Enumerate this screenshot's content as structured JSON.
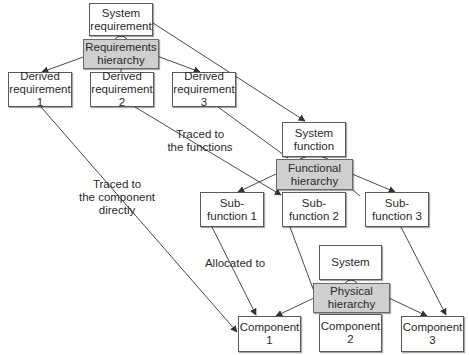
{
  "diagram": {
    "requirements": {
      "top": {
        "line1": "System",
        "line2": "requirement"
      },
      "hierarchy": {
        "line1": "Requirements",
        "line2": "hierarchy"
      },
      "children": [
        {
          "line1": "Derived",
          "line2": "requirement 1"
        },
        {
          "line1": "Derived",
          "line2": "requirement 2"
        },
        {
          "line1": "Derived",
          "line2": "requirement 3"
        }
      ]
    },
    "functional": {
      "top": {
        "line1": "System",
        "line2": "function"
      },
      "hierarchy": {
        "line1": "Functional",
        "line2": "hierarchy"
      },
      "children": [
        {
          "line1": "Sub-",
          "line2": "function 1"
        },
        {
          "line1": "Sub-",
          "line2": "function 2"
        },
        {
          "line1": "Sub-",
          "line2": "function 3"
        }
      ]
    },
    "physical": {
      "top": {
        "line1": "System"
      },
      "hierarchy": {
        "line1": "Physical",
        "line2": "hierarchy"
      },
      "children": [
        {
          "line1": "Component",
          "line2": "1"
        },
        {
          "line1": "Component",
          "line2": "2"
        },
        {
          "line1": "Component",
          "line2": "3"
        }
      ]
    },
    "annotations": {
      "traced_functions": {
        "line1": "Traced to",
        "line2": "the functions"
      },
      "traced_component": {
        "line1": "Traced to",
        "line2": "the component",
        "line3": "directly"
      },
      "allocated": {
        "line1": "Allocated to"
      }
    },
    "colors": {
      "line": "#4a4a4a",
      "hierarchy_fill": "#cfcfcf",
      "box_border": "#5a5a5a"
    }
  }
}
